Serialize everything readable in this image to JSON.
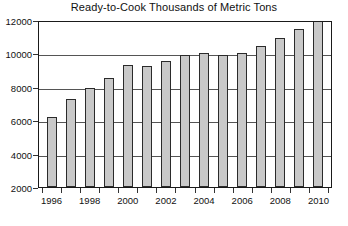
{
  "chart_data": {
    "type": "bar",
    "title": "Ready-to-Cook Thousands of Metric Tons",
    "xlabel": "",
    "ylabel": "",
    "categories": [
      "1996",
      "1997",
      "1998",
      "1999",
      "2000",
      "2001",
      "2002",
      "2003",
      "2004",
      "2005",
      "2006",
      "2007",
      "2008",
      "2009",
      "2010"
    ],
    "values": [
      6200,
      7250,
      7950,
      8500,
      9300,
      9250,
      9550,
      9900,
      10000,
      9900,
      10000,
      10450,
      10950,
      11450,
      11950
    ],
    "ylim": [
      2000,
      12000
    ],
    "ytick_values": [
      2000,
      4000,
      6000,
      8000,
      10000,
      12000
    ],
    "ytick_labels": [
      "2000",
      "4000",
      "6000",
      "8000",
      "10000",
      "12000"
    ],
    "xtick_labels_shown": [
      "1996",
      "1998",
      "2000",
      "2002",
      "2004",
      "2006",
      "2008",
      "2010"
    ],
    "grid": true,
    "legend": "none",
    "bar_fill_color": "#c9c9c9",
    "bar_border_color": "#2b2b2b",
    "axis_color": "#1a1a1a",
    "gridline_color": "#555555",
    "background_color": "#ffffff"
  }
}
